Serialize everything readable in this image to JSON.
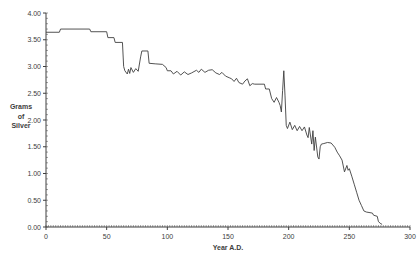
{
  "chart_data": {
    "type": "line",
    "title": "",
    "xlabel": "Year A.D.",
    "ylabel": "Grams of Silver",
    "ylabel_lines": [
      "Grams",
      "of",
      "Silver"
    ],
    "xlim": [
      0,
      300
    ],
    "ylim": [
      0.0,
      4.0
    ],
    "x_tick_step": 50,
    "x_minor_tick_step": 2,
    "y_tick_step": 0.5,
    "y_minor_tick_step": 0.1,
    "x_tick_labels": [
      "0",
      "50",
      "100",
      "150",
      "200",
      "250",
      "300"
    ],
    "y_tick_labels": [
      "0.00",
      "0.50",
      "1.00",
      "1.50",
      "2.00",
      "2.50",
      "3.00",
      "3.50",
      "4.00"
    ],
    "grid": false,
    "legend": "none",
    "line_color": "#3f3f3f",
    "axis_color": "#3f3f3f",
    "label_color": "#3d3d3d",
    "series_name": "silver-content-of-denarius",
    "points": [
      [
        0,
        3.64
      ],
      [
        11,
        3.64
      ],
      [
        12,
        3.7
      ],
      [
        36,
        3.7
      ],
      [
        37,
        3.65
      ],
      [
        50,
        3.65
      ],
      [
        51,
        3.54
      ],
      [
        56,
        3.54
      ],
      [
        57,
        3.45
      ],
      [
        63,
        3.45
      ],
      [
        64,
        3.0
      ],
      [
        65,
        2.92
      ],
      [
        67,
        2.86
      ],
      [
        68,
        2.95
      ],
      [
        69,
        2.87
      ],
      [
        70,
        2.98
      ],
      [
        72,
        2.89
      ],
      [
        74,
        2.96
      ],
      [
        76,
        2.91
      ],
      [
        78,
        3.18
      ],
      [
        79,
        3.29
      ],
      [
        84,
        3.29
      ],
      [
        85,
        3.06
      ],
      [
        90,
        3.05
      ],
      [
        96,
        3.04
      ],
      [
        99,
        2.98
      ],
      [
        100,
        2.92
      ],
      [
        103,
        2.92
      ],
      [
        105,
        2.86
      ],
      [
        108,
        2.91
      ],
      [
        111,
        2.84
      ],
      [
        114,
        2.9
      ],
      [
        117,
        2.85
      ],
      [
        120,
        2.88
      ],
      [
        124,
        2.93
      ],
      [
        126,
        2.89
      ],
      [
        128,
        2.95
      ],
      [
        131,
        2.89
      ],
      [
        134,
        2.93
      ],
      [
        137,
        2.94
      ],
      [
        140,
        2.88
      ],
      [
        143,
        2.85
      ],
      [
        145,
        2.89
      ],
      [
        148,
        2.82
      ],
      [
        151,
        2.79
      ],
      [
        153,
        2.77
      ],
      [
        155,
        2.72
      ],
      [
        157,
        2.78
      ],
      [
        159,
        2.7
      ],
      [
        162,
        2.67
      ],
      [
        164,
        2.73
      ],
      [
        166,
        2.77
      ],
      [
        168,
        2.64
      ],
      [
        170,
        2.68
      ],
      [
        172,
        2.67
      ],
      [
        180,
        2.67
      ],
      [
        181,
        2.58
      ],
      [
        184,
        2.58
      ],
      [
        186,
        2.4
      ],
      [
        188,
        2.33
      ],
      [
        190,
        2.42
      ],
      [
        192,
        2.33
      ],
      [
        193,
        2.27
      ],
      [
        194,
        2.15
      ],
      [
        195,
        2.55
      ],
      [
        196,
        2.92
      ],
      [
        197,
        2.45
      ],
      [
        198,
        1.9
      ],
      [
        199,
        1.84
      ],
      [
        201,
        1.96
      ],
      [
        203,
        1.82
      ],
      [
        205,
        1.9
      ],
      [
        207,
        1.8
      ],
      [
        209,
        1.88
      ],
      [
        211,
        1.8
      ],
      [
        213,
        1.87
      ],
      [
        215,
        1.72
      ],
      [
        216,
        1.67
      ],
      [
        217,
        1.86
      ],
      [
        219,
        1.55
      ],
      [
        220,
        1.8
      ],
      [
        221,
        1.43
      ],
      [
        222,
        1.68
      ],
      [
        224,
        1.31
      ],
      [
        225,
        1.27
      ],
      [
        226,
        1.5
      ],
      [
        227,
        1.55
      ],
      [
        229,
        1.56
      ],
      [
        232,
        1.58
      ],
      [
        235,
        1.57
      ],
      [
        238,
        1.49
      ],
      [
        240,
        1.4
      ],
      [
        242,
        1.33
      ],
      [
        244,
        1.25
      ],
      [
        246,
        1.03
      ],
      [
        248,
        1.15
      ],
      [
        249,
        1.06
      ],
      [
        250,
        1.09
      ],
      [
        252,
        0.95
      ],
      [
        254,
        0.8
      ],
      [
        256,
        0.65
      ],
      [
        258,
        0.5
      ],
      [
        260,
        0.4
      ],
      [
        262,
        0.3
      ],
      [
        264,
        0.28
      ],
      [
        269,
        0.26
      ],
      [
        270,
        0.22
      ],
      [
        273,
        0.2
      ],
      [
        274,
        0.1
      ],
      [
        276,
        0.06
      ],
      [
        277,
        0.05
      ]
    ],
    "layout": {
      "width": 419,
      "height": 258,
      "plot_left": 46,
      "plot_right": 410,
      "plot_top": 13,
      "plot_bottom": 227
    }
  }
}
